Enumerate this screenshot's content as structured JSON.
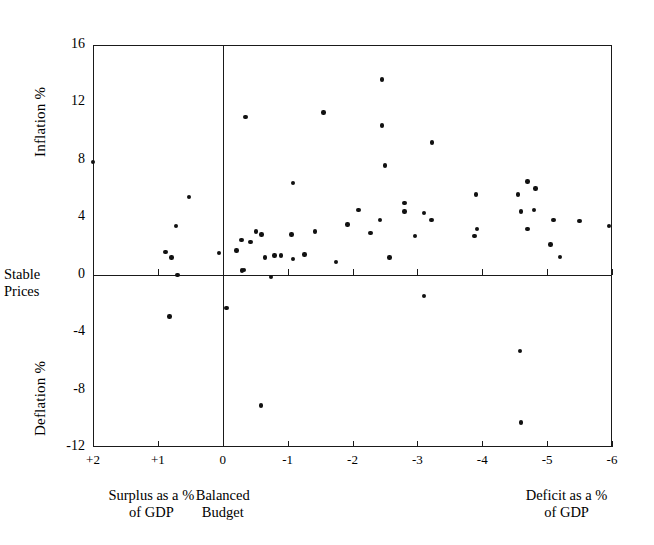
{
  "figure": {
    "type": "scatter",
    "background_color": "#ffffff",
    "ink_color": "#111111"
  },
  "axis_titles": {
    "y_upper": "Inflation %",
    "y_lower": "Deflation %",
    "stable_line_1": "Stable",
    "stable_line_2": "Prices",
    "x_left_line_1": "Surplus as a %",
    "x_left_line_2": "of GDP",
    "x_center_line_1": "Balanced",
    "x_center_line_2": "Budget",
    "x_right_line_1": "Deficit as a %",
    "x_right_line_2": "of GDP"
  },
  "x_ticks": [
    {
      "label": "+2",
      "value": 2
    },
    {
      "label": "+1",
      "value": 1
    },
    {
      "label": "0",
      "value": 0
    },
    {
      "label": "-1",
      "value": -1
    },
    {
      "label": "-2",
      "value": -2
    },
    {
      "label": "-3",
      "value": -3
    },
    {
      "label": "-4",
      "value": -4
    },
    {
      "label": "-5",
      "value": -5
    },
    {
      "label": "-6",
      "value": -6
    }
  ],
  "y_ticks": [
    {
      "label": "16",
      "value": 16
    },
    {
      "label": "12",
      "value": 12
    },
    {
      "label": "8",
      "value": 8
    },
    {
      "label": "4",
      "value": 4
    },
    {
      "label": "0",
      "value": 0
    },
    {
      "label": "-4",
      "value": -4
    },
    {
      "label": "-8",
      "value": -8
    },
    {
      "label": "-12",
      "value": -12
    }
  ],
  "chart_data": {
    "type": "scatter",
    "title": "",
    "xlabel": "Budget balance as a % of GDP (Surplus + / Deficit -)",
    "ylabel": "Inflation % / Deflation %",
    "xlim": [
      2,
      -6
    ],
    "ylim": [
      -12,
      16
    ],
    "x_axis_inverted": true,
    "grid": false,
    "legend": null,
    "reference_lines": [
      {
        "name": "balanced-budget",
        "orientation": "vertical",
        "value": 0
      },
      {
        "name": "stable-prices",
        "orientation": "horizontal",
        "value": 0
      }
    ],
    "points": [
      {
        "x": 2.0,
        "y": 7.85
      },
      {
        "x": 0.88,
        "y": 1.6
      },
      {
        "x": 0.79,
        "y": 1.2
      },
      {
        "x": 0.82,
        "y": -2.9
      },
      {
        "x": 0.72,
        "y": 3.4
      },
      {
        "x": 0.7,
        "y": 0.0
      },
      {
        "x": 0.52,
        "y": 5.4
      },
      {
        "x": 0.06,
        "y": 1.5
      },
      {
        "x": -0.06,
        "y": -2.3
      },
      {
        "x": -0.21,
        "y": 1.7
      },
      {
        "x": -0.29,
        "y": 2.4
      },
      {
        "x": -0.3,
        "y": 0.3
      },
      {
        "x": -0.33,
        "y": 0.35
      },
      {
        "x": -0.35,
        "y": 11.0
      },
      {
        "x": -0.43,
        "y": 2.3
      },
      {
        "x": -0.51,
        "y": 3.0
      },
      {
        "x": -0.59,
        "y": -9.1
      },
      {
        "x": -0.6,
        "y": 2.8
      },
      {
        "x": -0.65,
        "y": 1.2
      },
      {
        "x": -0.74,
        "y": -0.15
      },
      {
        "x": -0.8,
        "y": 1.35
      },
      {
        "x": -0.9,
        "y": 1.35
      },
      {
        "x": -1.06,
        "y": 2.8
      },
      {
        "x": -1.08,
        "y": 1.1
      },
      {
        "x": -1.08,
        "y": 6.4
      },
      {
        "x": -1.26,
        "y": 1.4
      },
      {
        "x": -1.42,
        "y": 3.0
      },
      {
        "x": -1.55,
        "y": 11.3
      },
      {
        "x": -1.75,
        "y": 0.9
      },
      {
        "x": -1.92,
        "y": 3.5
      },
      {
        "x": -2.09,
        "y": 4.5
      },
      {
        "x": -2.28,
        "y": 2.9
      },
      {
        "x": -2.42,
        "y": 3.8
      },
      {
        "x": -2.45,
        "y": 13.6
      },
      {
        "x": -2.45,
        "y": 10.4
      },
      {
        "x": -2.5,
        "y": 7.6
      },
      {
        "x": -2.57,
        "y": 1.2
      },
      {
        "x": -2.8,
        "y": 5.0
      },
      {
        "x": -2.8,
        "y": 4.4
      },
      {
        "x": -2.96,
        "y": 2.7
      },
      {
        "x": -3.1,
        "y": 4.3
      },
      {
        "x": -3.1,
        "y": -1.5
      },
      {
        "x": -3.22,
        "y": 3.8
      },
      {
        "x": -3.23,
        "y": 9.2
      },
      {
        "x": -3.88,
        "y": 2.7
      },
      {
        "x": -3.9,
        "y": 5.6
      },
      {
        "x": -3.92,
        "y": 3.2
      },
      {
        "x": -4.58,
        "y": -5.3
      },
      {
        "x": -4.6,
        "y": 4.4
      },
      {
        "x": -4.6,
        "y": -10.3
      },
      {
        "x": -4.7,
        "y": 3.2
      },
      {
        "x": -4.7,
        "y": 6.5
      },
      {
        "x": -4.82,
        "y": 6.0
      },
      {
        "x": -4.8,
        "y": 4.5
      },
      {
        "x": -4.55,
        "y": 5.6
      },
      {
        "x": -5.05,
        "y": 2.1
      },
      {
        "x": -5.1,
        "y": 3.8
      },
      {
        "x": -5.2,
        "y": 1.25
      },
      {
        "x": -5.5,
        "y": 3.75
      },
      {
        "x": -5.95,
        "y": 3.4
      }
    ]
  }
}
